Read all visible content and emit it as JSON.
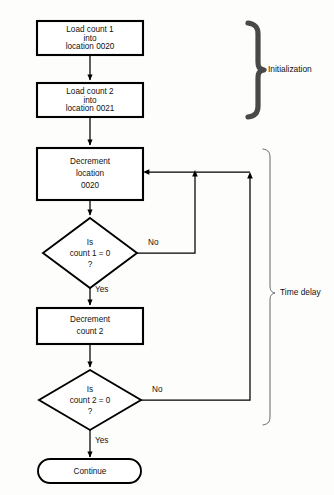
{
  "diagram": {
    "background_color": "#fdfdfc",
    "line_color": "#000000",
    "nodes": [
      {
        "id": "load-count-1",
        "type": "process",
        "lines": [
          "Load count 1",
          "into",
          "location 0020"
        ]
      },
      {
        "id": "load-count-2",
        "type": "process",
        "lines": [
          "Load count 2",
          "into",
          "location 0021"
        ]
      },
      {
        "id": "decrement-location-0020",
        "type": "process",
        "lines": [
          "Decrement",
          "location",
          "0020"
        ]
      },
      {
        "id": "is-count-1-zero",
        "type": "decision",
        "lines": [
          "Is",
          "count 1  =  0",
          "?"
        ]
      },
      {
        "id": "decrement-count-2",
        "type": "process",
        "lines": [
          "Decrement",
          "count 2"
        ]
      },
      {
        "id": "is-count-2-zero",
        "type": "decision",
        "lines": [
          "Is",
          "count 2  =  0",
          "?"
        ]
      },
      {
        "id": "continue",
        "type": "terminator",
        "lines": [
          "Continue"
        ]
      }
    ],
    "edge_labels": {
      "decision1_no": "No",
      "decision1_yes": "Yes",
      "decision2_no": "No",
      "decision2_yes": "Yes"
    },
    "annotations": [
      {
        "id": "initialization",
        "label": "Initialization"
      },
      {
        "id": "time-delay",
        "label": "Time delay"
      }
    ]
  }
}
